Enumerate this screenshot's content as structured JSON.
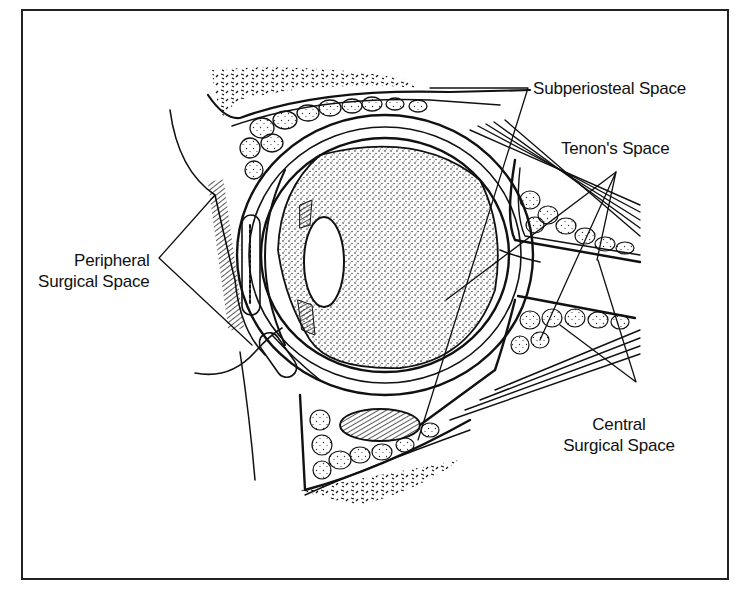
{
  "figure": {
    "labels": {
      "subperiosteal": {
        "text": "Subperiosteal Space"
      },
      "tenons": {
        "text": "Tenon's Space"
      },
      "peripheral": {
        "line1": "Peripheral",
        "line2": "Surgical Space"
      },
      "central": {
        "line1": "Central",
        "line2": "Surgical Space"
      }
    },
    "colors": {
      "ink": "#111111",
      "paper": "#ffffff",
      "frame": "#222222"
    }
  }
}
